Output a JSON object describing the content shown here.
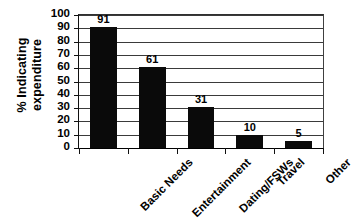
{
  "chart_data": {
    "type": "bar",
    "title": "",
    "xlabel": "",
    "ylabel": "% Indicating expenditure",
    "ylabel_line1": "% Indicating",
    "ylabel_line2": "expenditure",
    "categories": [
      "Basic Needs",
      "Entertainment",
      "Dating/FSWs",
      "Travel",
      "Other"
    ],
    "values": [
      91,
      61,
      31,
      10,
      5
    ],
    "data_labels": [
      "91",
      "61",
      "31",
      "10",
      "5"
    ],
    "ylim": [
      0,
      100
    ],
    "ytick_step": 10,
    "ytick_labels": [
      "100",
      "90",
      "80",
      "70",
      "60",
      "50",
      "40",
      "30",
      "20",
      "10",
      "0"
    ],
    "grid": true,
    "grid_axis": "y",
    "legend": false,
    "legend_position": "none",
    "bar_color": "#0a0a0a",
    "grid_color": "#3a3a3a",
    "axis_color": "#111111",
    "background_color": "#ffffff",
    "xtick_label_rotation": 45
  }
}
